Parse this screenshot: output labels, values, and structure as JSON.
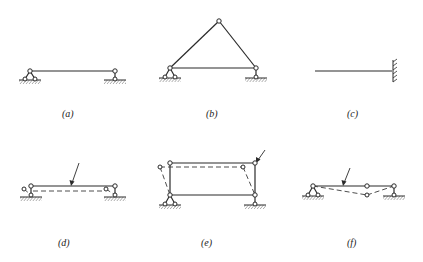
{
  "figure": {
    "width": 423,
    "height": 262,
    "background": "#ffffff",
    "ink": "#2a2a2a",
    "panels": [
      {
        "id": "a",
        "caption": "(a)",
        "caption_pos": [
          66,
          115
        ],
        "description": "Simply supported beam with pinned support (left, two-link) and roller/link support (right)",
        "members": [
          [
            30,
            71
          ],
          [
            115,
            71
          ]
        ],
        "dashed": [],
        "hinges": [
          [
            30,
            71
          ],
          [
            115,
            71
          ]
        ],
        "supports": [
          {
            "type": "pin",
            "x": 30,
            "y": 71
          },
          {
            "type": "link",
            "x": 115,
            "y": 71
          }
        ]
      },
      {
        "id": "b",
        "caption": "(b)",
        "caption_pos": [
          210,
          115
        ],
        "description": "Triangular three-hinged frame on pinned and link supports",
        "lines": [
          [
            [
              170,
              68
            ],
            [
              219,
              21
            ]
          ],
          [
            [
              219,
              21
            ],
            [
              256,
              68
            ]
          ],
          [
            [
              170,
              68
            ],
            [
              256,
              68
            ]
          ]
        ],
        "hinges": [
          [
            170,
            68
          ],
          [
            219,
            21
          ],
          [
            256,
            68
          ]
        ],
        "supports": [
          {
            "type": "pin",
            "x": 170,
            "y": 68
          },
          {
            "type": "link",
            "x": 256,
            "y": 68
          }
        ]
      },
      {
        "id": "c",
        "caption": "(c)",
        "caption_pos": [
          351,
          115
        ],
        "description": "Cantilever beam with fixed support on the right",
        "lines": [
          [
            [
              315,
              71
            ],
            [
              392,
              71
            ]
          ]
        ],
        "supports": [
          {
            "type": "fixed-right",
            "x": 392,
            "y": 71
          }
        ]
      },
      {
        "id": "d",
        "caption": "(d)",
        "caption_pos": [
          62,
          244
        ],
        "description": "Beam mechanism with displaced (dashed) configuration and load arrow",
        "lines": [
          [
            [
              31,
              186
            ],
            [
              115,
              186
            ]
          ],
          [
            [
              31,
              195
            ],
            [
              31,
              186
            ]
          ],
          [
            [
              115,
              186
            ],
            [
              115,
              195
            ]
          ]
        ],
        "dashed_lines": [
          [
            [
              32,
              191
            ],
            [
              105,
              191
            ]
          ],
          [
            [
              24,
              189
            ],
            [
              31,
              195
            ]
          ],
          [
            [
              105,
              191
            ],
            [
              115,
              195
            ]
          ]
        ],
        "hinges": [
          [
            31,
            186
          ],
          [
            115,
            186
          ],
          [
            24,
            189
          ],
          [
            105,
            189
          ],
          [
            31,
            195
          ],
          [
            115,
            195
          ]
        ],
        "supports": [
          {
            "type": "ground",
            "x": 31,
            "y": 195
          },
          {
            "type": "ground",
            "x": 115,
            "y": 195
          }
        ],
        "arrow": {
          "from": [
            79,
            163
          ],
          "to": [
            72,
            185
          ]
        }
      },
      {
        "id": "e",
        "caption": "(e)",
        "caption_pos": [
          205,
          244
        ],
        "description": "Portal frame mechanism with sway (dashed) configuration and load arrow",
        "lines": [
          [
            [
              170,
              163
            ],
            [
              255,
              163
            ]
          ],
          [
            [
              170,
              163
            ],
            [
              170,
              195
            ]
          ],
          [
            [
              170,
              195
            ],
            [
              255,
              195
            ]
          ],
          [
            [
              255,
              163
            ],
            [
              255,
              195
            ]
          ]
        ],
        "dashed_lines": [
          [
            [
              160,
              167
            ],
            [
              243,
              167
            ]
          ],
          [
            [
              160,
              167
            ],
            [
              170,
              195
            ]
          ],
          [
            [
              243,
              167
            ],
            [
              255,
              195
            ]
          ]
        ],
        "hinges": [
          [
            170,
            163
          ],
          [
            255,
            163
          ],
          [
            160,
            167
          ],
          [
            243,
            167
          ],
          [
            170,
            195
          ],
          [
            255,
            195
          ]
        ],
        "supports": [
          {
            "type": "pin",
            "x": 170,
            "y": 195
          },
          {
            "type": "link",
            "x": 255,
            "y": 195
          }
        ],
        "arrow": {
          "from": [
            265,
            150
          ],
          "to": [
            256,
            162
          ]
        }
      },
      {
        "id": "f",
        "caption": "(f)",
        "caption_pos": [
          351,
          244
        ],
        "description": "Two-span hinged beam mechanism with sagging (dashed) configuration and load arrow",
        "lines": [
          [
            [
              313,
              186
            ],
            [
              367,
              186
            ]
          ],
          [
            [
              367,
              186
            ],
            [
              394,
              186
            ]
          ]
        ],
        "dashed_lines": [
          [
            [
              313,
              186
            ],
            [
              367,
              195
            ]
          ],
          [
            [
              367,
              195
            ],
            [
              394,
              186
            ]
          ]
        ],
        "hinges": [
          [
            313,
            186
          ],
          [
            367,
            186
          ],
          [
            394,
            186
          ],
          [
            367,
            195
          ]
        ],
        "supports": [
          {
            "type": "pin",
            "x": 313,
            "y": 186
          },
          {
            "type": "link",
            "x": 394,
            "y": 186
          }
        ],
        "arrow": {
          "from": [
            350,
            168
          ],
          "to": [
            343,
            185
          ]
        }
      }
    ]
  }
}
